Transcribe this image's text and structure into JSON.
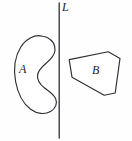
{
  "figure": {
    "type": "geometry-diagram",
    "background_color": "#fefefe",
    "stroke_color": "#2e2e34",
    "width": 132,
    "height": 141,
    "labels": {
      "region_a": "A",
      "region_b": "B",
      "line": "L"
    },
    "elements": [
      {
        "name": "region-a",
        "label": "A",
        "shape": "crescent",
        "convex": false,
        "side_of_line": "left",
        "label_position": {
          "x": 23,
          "y": 70
        }
      },
      {
        "name": "region-b",
        "label": "B",
        "shape": "polygon",
        "convex": true,
        "side_of_line": "right",
        "vertices": [
          {
            "x": 69,
            "y": 59
          },
          {
            "x": 108,
            "y": 52
          },
          {
            "x": 120,
            "y": 58
          },
          {
            "x": 115,
            "y": 93
          },
          {
            "x": 104,
            "y": 95
          },
          {
            "x": 72,
            "y": 77
          }
        ],
        "label_position": {
          "x": 97,
          "y": 71
        }
      },
      {
        "name": "line-l",
        "label": "L",
        "shape": "vertical-line",
        "x": 59,
        "y_start": 3,
        "y_end": 138,
        "label_position": {
          "x": 65,
          "y": 8
        }
      }
    ]
  }
}
